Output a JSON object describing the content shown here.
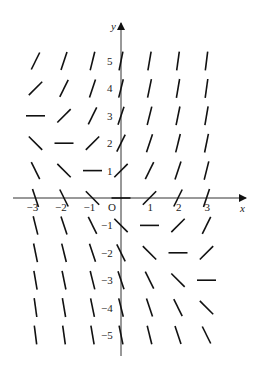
{
  "diagram": {
    "type": "slope_field",
    "equation_hint": "dy/dx = x + y",
    "x_axis": {
      "label": "x",
      "ticks": [
        "-3",
        "-2",
        "-1",
        "1",
        "2",
        "3"
      ],
      "range": [
        -3,
        3
      ]
    },
    "y_axis": {
      "label": "y",
      "ticks": [
        "5",
        "4",
        "3",
        "2",
        "1",
        "-1",
        "-2",
        "-3",
        "-4",
        "-5"
      ],
      "range": [
        -5,
        5
      ]
    },
    "origin_label": "O",
    "grid_x": [
      -3,
      -2,
      -1,
      0,
      1,
      2,
      3
    ],
    "grid_y": [
      -5,
      -4,
      -3,
      -2,
      -1,
      0,
      1,
      2,
      3,
      4,
      5
    ],
    "line_color": "#111111"
  }
}
